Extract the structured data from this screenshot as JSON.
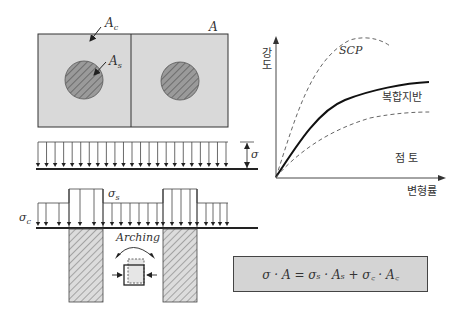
{
  "figure": {
    "plan_view": {
      "label_Ac": "A",
      "label_Ac_sub": "c",
      "label_As": "A",
      "label_As_sub": "s",
      "label_A": "A"
    },
    "uniform_load": {
      "label_sigma": "σ"
    },
    "composite_load": {
      "label_sigma_s": "σ",
      "label_sigma_s_sub": "s",
      "label_sigma_c": "σ",
      "label_sigma_c_sub": "c",
      "label_arching": "Arching"
    },
    "graph": {
      "ylabel_line1": "강",
      "ylabel_line2": "도",
      "xlabel": "변형률",
      "curve_scp": "SCP",
      "curve_composite": "복합지반",
      "curve_clay": "점 토"
    },
    "equation": "σ · A = σₛ · Aₛ + σ꜀ · A꜀"
  },
  "colors": {
    "box_fill": "#d9d9d9",
    "circle_fill": "#8a8a8a",
    "line": "#222222",
    "eq_fill": "#d4d4d4"
  },
  "chart_data": {
    "type": "line",
    "title": "",
    "xlabel": "변형률",
    "ylabel": "강도",
    "grid": false,
    "series": [
      {
        "name": "SCP",
        "style": "dashed",
        "shape": "rises steeply, peaks, then softens"
      },
      {
        "name": "복합지반",
        "style": "solid",
        "shape": "intermediate, monotonically rising and flattening"
      },
      {
        "name": "점 토",
        "style": "dashed",
        "shape": "lowest, gradually rising and flattening"
      }
    ]
  }
}
